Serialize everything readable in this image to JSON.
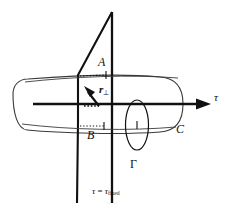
{
  "figure": {
    "background_color": "#ffffff",
    "line_color": "#111111",
    "thin_line_color": "#3a3a3a",
    "width": 231,
    "height": 211,
    "labels": {
      "point_a": "A",
      "point_b": "B",
      "surface_c": "C",
      "loop_gamma": "Γ",
      "axis_tau": "τ",
      "vector_r_perp_symbol": "r",
      "vector_r_perp_subscript": "⊥",
      "plane_equation_lhs": "τ",
      "plane_equation_eq": "=",
      "plane_equation_rhs_symbol": "τ",
      "plane_equation_rhs_subscript": "fixed"
    },
    "elements": {
      "axis_name": "tau-axis",
      "tube_name": "worldtube-outline",
      "plane_name": "fixed-time-plane",
      "loop_name": "gamma-loop",
      "vector_name": "r-perp-vector"
    }
  }
}
